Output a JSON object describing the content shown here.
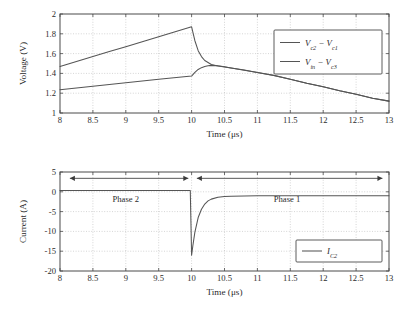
{
  "figure": {
    "background": "#ffffff",
    "line_color": "#555555",
    "grid_color": "#b9b9b9",
    "axis_color": "#4a4a4a"
  },
  "chart_data": [
    {
      "type": "line",
      "id": "voltage-vs-time",
      "title": "",
      "xlabel": "Time (μs)",
      "ylabel": "Voltage (V)",
      "xlim": [
        8,
        13
      ],
      "ylim": [
        1,
        2
      ],
      "xticks": [
        8,
        8.5,
        9,
        9.5,
        10,
        10.5,
        11,
        11.5,
        12,
        12.5,
        13
      ],
      "xticklabels": [
        "8",
        "8.5",
        "9",
        "9.5",
        "10",
        "10.5",
        "11",
        "11.5",
        "12",
        "12.5",
        "13"
      ],
      "yticks": [
        1,
        1.2,
        1.4,
        1.6,
        1.8,
        2
      ],
      "yticklabels": [
        "1",
        "1.2",
        "1.4",
        "1.6",
        "1.8",
        "2"
      ],
      "grid": true,
      "legend_position": "upper right",
      "series": [
        {
          "name": "Vc2 - Vc1",
          "label_main_1": "V",
          "label_sub_1": "c2",
          "label_op": " − ",
          "label_main_2": "V",
          "label_sub_2": "c1",
          "x": [
            8,
            8.25,
            8.5,
            8.75,
            9,
            9.25,
            9.5,
            9.75,
            10,
            10.05,
            10.1,
            10.15,
            10.2,
            10.3,
            10.4,
            10.5,
            10.6,
            10.8,
            11,
            11.25,
            11.5,
            11.75,
            12,
            12.25,
            12.5,
            12.75,
            13
          ],
          "y": [
            1.47,
            1.52,
            1.57,
            1.62,
            1.67,
            1.72,
            1.77,
            1.82,
            1.87,
            1.73,
            1.63,
            1.57,
            1.53,
            1.49,
            1.475,
            1.465,
            1.455,
            1.435,
            1.41,
            1.38,
            1.34,
            1.3,
            1.265,
            1.225,
            1.19,
            1.15,
            1.12
          ]
        },
        {
          "name": "Vin - Vc3",
          "label_main_1": "V",
          "label_sub_1": "in",
          "label_op": " − ",
          "label_main_2": "V",
          "label_sub_2": "c3",
          "x": [
            8,
            8.5,
            9,
            9.5,
            10,
            10.05,
            10.1,
            10.15,
            10.2,
            10.25,
            10.3,
            10.4,
            10.5,
            10.6,
            10.8,
            11,
            11.25,
            11.5,
            11.75,
            12,
            12.25,
            12.5,
            12.75,
            13
          ],
          "y": [
            1.235,
            1.27,
            1.305,
            1.34,
            1.373,
            1.41,
            1.44,
            1.458,
            1.47,
            1.477,
            1.481,
            1.478,
            1.468,
            1.455,
            1.432,
            1.409,
            1.379,
            1.34,
            1.3,
            1.264,
            1.225,
            1.19,
            1.15,
            1.12
          ]
        }
      ]
    },
    {
      "type": "line",
      "id": "current-vs-time",
      "title": "",
      "xlabel": "Time (μs)",
      "ylabel": "Current (A)",
      "xlim": [
        8,
        13
      ],
      "ylim": [
        -20,
        5
      ],
      "xticks": [
        8,
        8.5,
        9,
        9.5,
        10,
        10.5,
        11,
        11.5,
        12,
        12.5,
        13
      ],
      "xticklabels": [
        "8",
        "8.5",
        "9",
        "9.5",
        "10",
        "10.5",
        "11",
        "11.5",
        "12",
        "12.5",
        "13"
      ],
      "yticks": [
        -20,
        -15,
        -10,
        -5,
        0,
        5
      ],
      "yticklabels": [
        "-20",
        "-15",
        "-10",
        "-5",
        "0",
        "5"
      ],
      "grid": true,
      "legend_position": "lower right",
      "series": [
        {
          "name": "IC2",
          "label_main_1": "I",
          "label_sub_1": "C2",
          "x": [
            8,
            9,
            9.5,
            9.9,
            9.98,
            10,
            10.02,
            10.05,
            10.1,
            10.15,
            10.2,
            10.25,
            10.3,
            10.4,
            10.5,
            10.6,
            10.8,
            11,
            11.5,
            12,
            12.5,
            13
          ],
          "y": [
            0.35,
            0.35,
            0.35,
            0.35,
            0.35,
            -16.0,
            -13.5,
            -10.2,
            -6.5,
            -4.4,
            -3.1,
            -2.3,
            -1.85,
            -1.4,
            -1.2,
            -1.1,
            -1.05,
            -1.0,
            -1.0,
            -1.0,
            -1.0,
            -1.0
          ]
        }
      ],
      "annotations": [
        {
          "name": "phase-2",
          "text": "Phase 2",
          "x": 9.0,
          "y": -2.6,
          "arrow_from": 8.15,
          "arrow_to": 9.95,
          "arrow_y": 3.4
        },
        {
          "name": "phase-1",
          "text": "Phase 1",
          "x": 11.45,
          "y": -2.6,
          "arrow_from": 10.08,
          "arrow_to": 12.9,
          "arrow_y": 3.4
        }
      ]
    }
  ]
}
